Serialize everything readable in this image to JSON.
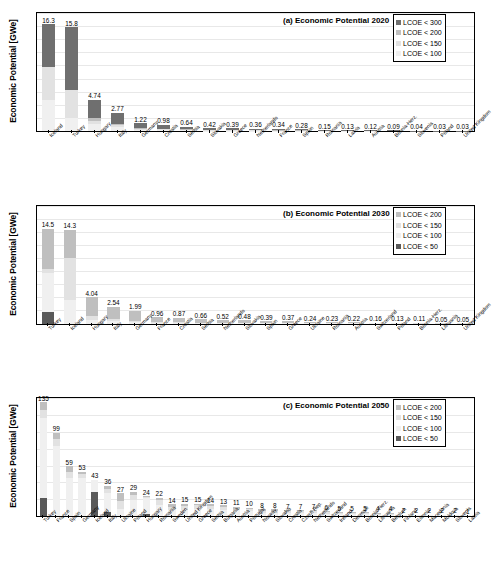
{
  "figure": {
    "ylabel": "Economic Potential [GWe]",
    "colors": {
      "lcoe_300": "#6f6f6f",
      "lcoe_200": "#bfbfbf",
      "lcoe_150": "#e2e2e2",
      "lcoe_100": "#f0f0f0",
      "lcoe_50": "#595959",
      "grid": "#e8e8e8",
      "axis": "#000000"
    }
  },
  "chart_data": [
    {
      "type": "bar",
      "panel": "a",
      "title": "(a) Economic Potential 2020",
      "ylabel": "Economic Potential [GWe]",
      "xlabel": "",
      "ylim": [
        0,
        18
      ],
      "yticks": [
        0,
        2,
        4,
        6,
        8,
        10,
        12,
        14,
        16,
        18
      ],
      "grid": true,
      "legend_position": "top-right",
      "legend": [
        "LCOE < 300",
        "LCOE < 200",
        "LCOE < 150",
        "LCOE < 100"
      ],
      "categories": [
        "Iceland",
        "Turkey",
        "Hungary",
        "Italy",
        "Germany",
        "Croatia",
        "Serbia",
        "Slovakia",
        "Greece",
        "Netherlands",
        "France",
        "Spain",
        "Romania",
        "Latvia",
        "Austria",
        "Bosnia-Herz.",
        "Slovenia",
        "Poland",
        "United Kingdom"
      ],
      "values": [
        16.3,
        15.8,
        4.74,
        2.77,
        1.22,
        0.98,
        0.64,
        0.42,
        0.39,
        0.36,
        0.34,
        0.28,
        0.15,
        0.13,
        0.12,
        0.09,
        0.04,
        0.03,
        0.03
      ],
      "series": [
        {
          "name": "LCOE < 100",
          "values": [
            4.7,
            1.95,
            1.05,
            0.55,
            0.18,
            0.14,
            0.1,
            0.06,
            0.06,
            0.05,
            0.05,
            0.04,
            0.02,
            0.02,
            0.02,
            0.01,
            0.01,
            0.0,
            0.0
          ]
        },
        {
          "name": "LCOE < 150",
          "values": [
            5.0,
            4.35,
            0.45,
            0.3,
            0.12,
            0.1,
            0.07,
            0.04,
            0.04,
            0.04,
            0.03,
            0.03,
            0.02,
            0.01,
            0.01,
            0.01,
            0.0,
            0.0,
            0.0
          ]
        },
        {
          "name": "LCOE < 200",
          "values": [
            0.0,
            0.0,
            0.55,
            0.3,
            0.14,
            0.1,
            0.07,
            0.05,
            0.04,
            0.04,
            0.04,
            0.03,
            0.02,
            0.02,
            0.01,
            0.01,
            0.01,
            0.01,
            0.01
          ]
        },
        {
          "name": "LCOE < 300",
          "values": [
            6.6,
            9.5,
            2.69,
            1.62,
            0.78,
            0.64,
            0.4,
            0.27,
            0.25,
            0.23,
            0.22,
            0.18,
            0.09,
            0.08,
            0.08,
            0.06,
            0.02,
            0.02,
            0.02
          ]
        }
      ]
    },
    {
      "type": "bar",
      "panel": "b",
      "title": "(b) Economic Potential 2030",
      "ylabel": "Economic Potential [GWe]",
      "xlabel": "",
      "ylim": [
        0,
        18
      ],
      "yticks": [
        0,
        2,
        4,
        6,
        8,
        10,
        12,
        14,
        16,
        18
      ],
      "grid": true,
      "legend_position": "top-right",
      "legend": [
        "LCOE < 200",
        "LCOE < 150",
        "LCOE < 100",
        "LCOE < 50"
      ],
      "categories": [
        "Turkey",
        "Iceland",
        "Hungary",
        "Italy",
        "Germany",
        "France",
        "Croatia",
        "Serbia",
        "Netherlands",
        "Slovakia",
        "Spain",
        "Greece",
        "Ukraine",
        "Romania",
        "Austria",
        "Switzerland",
        "Poland",
        "Bosnia-Herz.",
        "Lithuania",
        "United Kingdom"
      ],
      "values": [
        14.5,
        14.3,
        4.04,
        2.54,
        1.99,
        0.96,
        0.87,
        0.66,
        0.52,
        0.48,
        0.39,
        0.37,
        0.24,
        0.23,
        0.22,
        0.16,
        0.13,
        0.11,
        0.05,
        0.05
      ],
      "series": [
        {
          "name": "LCOE < 50",
          "values": [
            1.7,
            0.0,
            0.0,
            0.0,
            0.0,
            0.0,
            0.0,
            0.0,
            0.0,
            0.0,
            0.0,
            0.0,
            0.0,
            0.0,
            0.0,
            0.0,
            0.0,
            0.0,
            0.0,
            0.0
          ]
        },
        {
          "name": "LCOE < 100",
          "values": [
            6.05,
            3.6,
            0.55,
            0.35,
            0.22,
            0.12,
            0.11,
            0.09,
            0.07,
            0.06,
            0.05,
            0.05,
            0.03,
            0.03,
            0.03,
            0.02,
            0.02,
            0.01,
            0.01,
            0.01
          ]
        },
        {
          "name": "LCOE < 150",
          "values": [
            0.55,
            6.4,
            0.6,
            0.35,
            0.25,
            0.12,
            0.11,
            0.08,
            0.07,
            0.06,
            0.05,
            0.05,
            0.03,
            0.03,
            0.03,
            0.02,
            0.02,
            0.01,
            0.01,
            0.01
          ]
        },
        {
          "name": "LCOE < 200",
          "values": [
            6.2,
            4.3,
            2.89,
            1.84,
            1.52,
            0.72,
            0.65,
            0.49,
            0.38,
            0.36,
            0.29,
            0.27,
            0.18,
            0.17,
            0.16,
            0.12,
            0.09,
            0.09,
            0.03,
            0.03
          ]
        }
      ]
    },
    {
      "type": "bar",
      "panel": "c",
      "title": "(c) Economic Potential 2050",
      "ylabel": "Economic Potential [GWe]",
      "xlabel": "",
      "ylim": [
        0,
        140
      ],
      "yticks": [
        0,
        20,
        40,
        60,
        80,
        100,
        120,
        140
      ],
      "grid": true,
      "legend_position": "top-right",
      "legend": [
        "LCOE < 200",
        "LCOE < 150",
        "LCOE < 100",
        "LCOE < 50"
      ],
      "categories": [
        "Turkey",
        "France",
        "Spain",
        "Germany",
        "Iceland",
        "Italy",
        "Ukraine",
        "Poland",
        "Hungary",
        "Romania",
        "Sweden",
        "United Kingdom",
        "Greece",
        "Serbia",
        "Bulgaria",
        "Austria",
        "Portugal",
        "Norway",
        "Slovakia",
        "Croatia",
        "Czech Rep.",
        "Netherlands",
        "Switzerland",
        "Ireland",
        "Denmark",
        "Bosnia-Herz.",
        "Lithuania",
        "Belgium",
        "Finland",
        "Estonia",
        "Macedonia",
        "Moldova",
        "Slovenia",
        "Latvia"
      ],
      "values": [
        135,
        99,
        59,
        53,
        43,
        36,
        27,
        29,
        24,
        22,
        14,
        15,
        15,
        14,
        13,
        11,
        10,
        8,
        8,
        7,
        7,
        7,
        6,
        5,
        5,
        5,
        4,
        4,
        2,
        2,
        2,
        2,
        2,
        1
      ],
      "series": [
        {
          "name": "LCOE < 50",
          "values": [
            22,
            0,
            0,
            0,
            29,
            5,
            0,
            0,
            3,
            0,
            0,
            0,
            0,
            0,
            0,
            0,
            0,
            0,
            0,
            0,
            0,
            0,
            0,
            0,
            0,
            0,
            0,
            0,
            0,
            0,
            0,
            0,
            0,
            0
          ]
        },
        {
          "name": "LCOE < 100",
          "values": [
            94,
            83,
            45,
            45,
            14,
            22,
            9,
            19,
            19,
            13,
            7,
            7,
            9,
            9,
            7,
            7,
            6,
            4,
            4,
            4,
            4,
            4,
            3,
            3,
            3,
            3,
            2,
            2,
            1,
            1,
            1,
            1,
            1,
            1
          ]
        },
        {
          "name": "LCOE < 150",
          "values": [
            10,
            9,
            8,
            5,
            0,
            5,
            9,
            6,
            1,
            6,
            4,
            5,
            4,
            3,
            4,
            2,
            2,
            2,
            2,
            2,
            2,
            2,
            2,
            1,
            1,
            1,
            1,
            1,
            1,
            1,
            1,
            1,
            1,
            0
          ]
        },
        {
          "name": "LCOE < 200",
          "values": [
            9,
            7,
            6,
            3,
            0,
            4,
            9,
            4,
            1,
            3,
            3,
            3,
            2,
            2,
            2,
            2,
            2,
            2,
            2,
            1,
            1,
            1,
            1,
            1,
            1,
            1,
            1,
            1,
            0,
            0,
            0,
            0,
            0,
            0
          ]
        }
      ]
    }
  ]
}
